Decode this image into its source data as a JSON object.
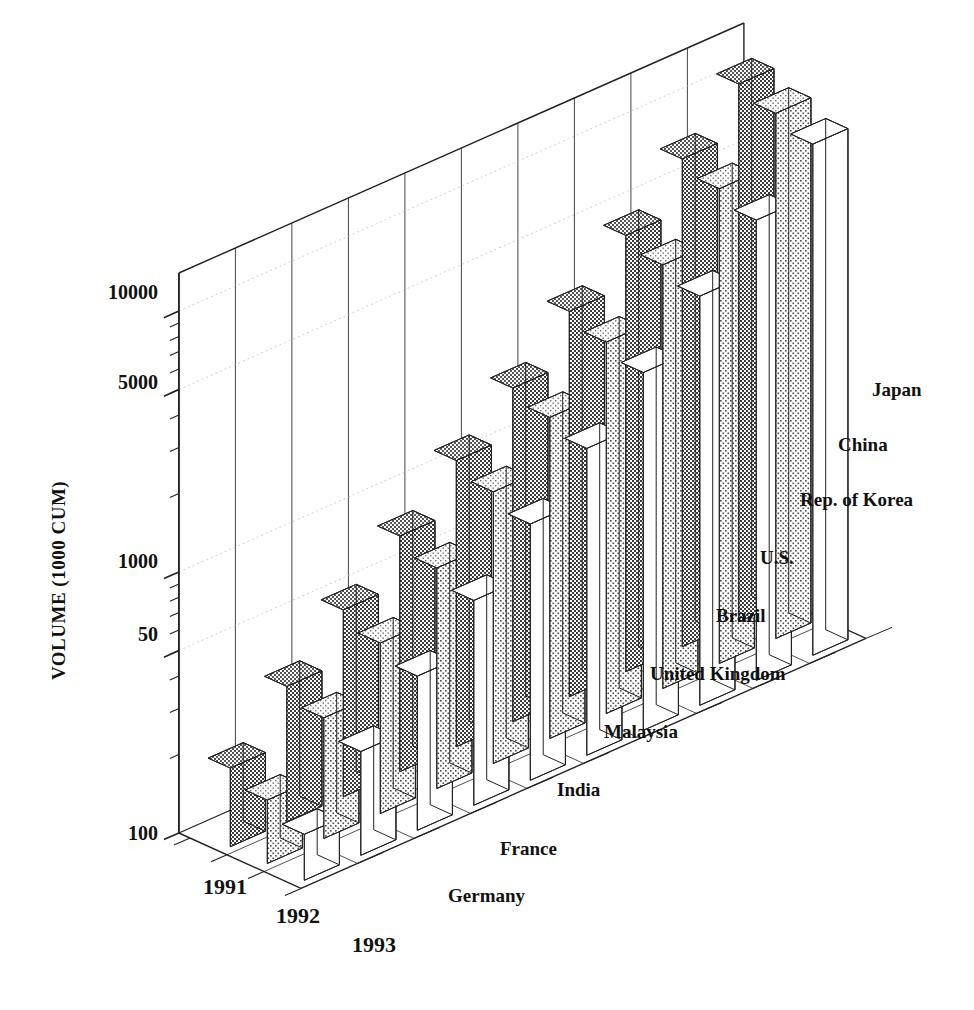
{
  "chart_data": {
    "type": "bar",
    "title": "",
    "subtitle": "",
    "xlabel": "",
    "ylabel": "VOLUME (1000 CUM)",
    "zlabel": "",
    "y_scale": "log",
    "grid": true,
    "legend_position": "none",
    "axis_note": "3D grouped bar chart: depth axis = years, horizontal axis = countries",
    "y_tick_labels": [
      "10000",
      "5000",
      "1000",
      "50",
      "100"
    ],
    "y_tick_values": [
      10000,
      5000,
      1000,
      500,
      100
    ],
    "ylim": [
      100,
      14000
    ],
    "categories": [
      "Germany",
      "France",
      "India",
      "Malaysia",
      "United Kingdom",
      "Brazil",
      "U.S.",
      "Rep. of Korea",
      "China",
      "Japan"
    ],
    "x": [
      "1991",
      "1992",
      "1993"
    ],
    "series": [
      {
        "name": "1991",
        "pattern": "dark-stipple",
        "values": [
          200,
          330,
          520,
          800,
          1250,
          1900,
          3000,
          4700,
          7400,
          11500
        ]
      },
      {
        "name": "1992",
        "pattern": "light-stipple",
        "values": [
          175,
          290,
          450,
          700,
          1100,
          1700,
          2650,
          4200,
          6600,
          10300
        ]
      },
      {
        "name": "1993",
        "pattern": "white",
        "values": [
          150,
          250,
          390,
          610,
          960,
          1500,
          2350,
          3700,
          5800,
          9100
        ]
      }
    ]
  },
  "axes": {
    "y_title": "VOLUME (1000 CUM)",
    "y_ticks": [
      {
        "label": "10000"
      },
      {
        "label": "5000"
      },
      {
        "label": "1000"
      },
      {
        "label": "50"
      },
      {
        "label": "100"
      }
    ]
  },
  "countries": [
    {
      "label": "Germany"
    },
    {
      "label": "France"
    },
    {
      "label": "India"
    },
    {
      "label": "Malaysia"
    },
    {
      "label": "United Kingdom"
    },
    {
      "label": "Brazil"
    },
    {
      "label": "U.S."
    },
    {
      "label": "Rep. of Korea"
    },
    {
      "label": "China"
    },
    {
      "label": "Japan"
    }
  ],
  "years": [
    {
      "label": "1991"
    },
    {
      "label": "1992"
    },
    {
      "label": "1993"
    }
  ],
  "colors": {
    "ink": "#1a1a1a",
    "line": "#222222",
    "grid": "#b9b9b9",
    "series_1991": "#8a8a8a",
    "series_1992": "#c3c3c3",
    "series_1993": "#ffffff",
    "background": "#ffffff"
  }
}
